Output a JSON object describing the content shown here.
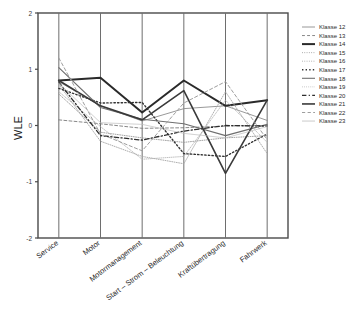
{
  "chart_data": {
    "type": "line",
    "title": "",
    "xlabel": "",
    "ylabel": "WLE",
    "ylim": [
      -2,
      2
    ],
    "yticks": [
      2,
      1,
      0,
      -1,
      -2
    ],
    "ytick_labels": [
      "2",
      "1",
      "0",
      "-1",
      "-2"
    ],
    "grid": "vertical-category-lines",
    "legend_position": "right",
    "categories": [
      "Service",
      "Motor",
      "Motormanagement",
      "Start – Strom – Beleuchtung",
      "Kraftübertragung",
      "Fahrwerk"
    ],
    "series": [
      {
        "name": "Klasse 12",
        "values": [
          0.78,
          0.35,
          0.08,
          0.3,
          0.35,
          0.09
        ],
        "style": "solid",
        "width": 0.9,
        "color": "#8d8d8d"
      },
      {
        "name": "Klasse 13",
        "values": [
          0.1,
          0.03,
          -0.05,
          -0.04,
          -0.01,
          0.0
        ],
        "style": "dashed",
        "width": 0.9,
        "color": "#7a7a7a"
      },
      {
        "name": "Klasse 14",
        "values": [
          0.8,
          0.85,
          0.23,
          0.8,
          0.35,
          0.45
        ],
        "style": "solid",
        "width": 2.0,
        "color": "#2a2a2a"
      },
      {
        "name": "Klasse 15",
        "values": [
          0.56,
          -0.12,
          -0.22,
          -0.3,
          -0.22,
          -0.18
        ],
        "style": "dotted",
        "width": 0.9,
        "color": "#9a9a9a"
      },
      {
        "name": "Klasse 16",
        "values": [
          0.73,
          -0.28,
          -0.55,
          -0.68,
          0.6,
          -0.5
        ],
        "style": "dotted",
        "width": 0.9,
        "color": "#a5a5a5"
      },
      {
        "name": "Klasse 17",
        "values": [
          0.66,
          0.4,
          0.41,
          -0.5,
          -0.55,
          -0.15
        ],
        "style": "dotted",
        "width": 1.4,
        "color": "#333333"
      },
      {
        "name": "Klasse 18",
        "values": [
          1.03,
          0.32,
          0.11,
          0.03,
          -0.18,
          0.02
        ],
        "style": "solid",
        "width": 1.1,
        "color": "#6f6f6f"
      },
      {
        "name": "Klasse 19",
        "values": [
          0.6,
          -0.02,
          -0.6,
          -0.55,
          0.45,
          -0.3
        ],
        "style": "dotted",
        "width": 0.8,
        "color": "#b0b0b0"
      },
      {
        "name": "Klasse 20",
        "values": [
          0.77,
          -0.18,
          -0.26,
          -0.1,
          0.0,
          -0.01
        ],
        "style": "dashdot",
        "width": 1.3,
        "color": "#2e2e2e"
      },
      {
        "name": "Klasse 21",
        "values": [
          0.8,
          0.35,
          0.1,
          0.62,
          -0.85,
          0.45
        ],
        "style": "solid",
        "width": 1.6,
        "color": "#3a3a3a"
      },
      {
        "name": "Klasse 22",
        "values": [
          1.2,
          -0.15,
          -0.45,
          0.4,
          0.78,
          -0.25
        ],
        "style": "dashed",
        "width": 1.0,
        "color": "#9e9e9e"
      },
      {
        "name": "Klasse 23",
        "values": [
          0.75,
          0.05,
          0.02,
          -0.14,
          -0.22,
          -0.02
        ],
        "style": "solid",
        "width": 0.7,
        "color": "#bdbdbd"
      }
    ]
  },
  "axis": {
    "y_title": "WLE"
  }
}
